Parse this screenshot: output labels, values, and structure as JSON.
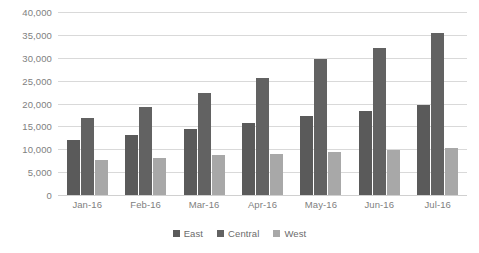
{
  "chart_data": {
    "type": "bar",
    "title": "",
    "subtitle": "",
    "xlabel": "",
    "ylabel": "",
    "categories": [
      "Jan-16",
      "Feb-16",
      "Mar-16",
      "Apr-16",
      "May-16",
      "Jun-16",
      "Jul-16"
    ],
    "series": [
      {
        "name": "East",
        "color": "#5a5a5a",
        "values": [
          12000,
          13200,
          14400,
          15700,
          17200,
          18400,
          19700
        ]
      },
      {
        "name": "Central",
        "color": "#626262",
        "values": [
          16800,
          19200,
          22200,
          25500,
          29700,
          32200,
          35500
        ]
      },
      {
        "name": "West",
        "color": "#a8a8a8",
        "values": [
          7700,
          8200,
          8700,
          9000,
          9400,
          9800,
          10300
        ]
      }
    ],
    "ylim": [
      0,
      40000
    ],
    "ytick_values": [
      0,
      5000,
      10000,
      15000,
      20000,
      25000,
      30000,
      35000,
      40000
    ],
    "ytick_labels": [
      "0",
      "5,000",
      "10,000",
      "15,000",
      "20,000",
      "25,000",
      "30,000",
      "35,000",
      "40,000"
    ],
    "grid": true,
    "grid_axis": "y",
    "grid_color": "#d9d9d9",
    "legend": true,
    "legend_position": "bottom",
    "background_color": "#ffffff",
    "axis_label_color": "#808080"
  }
}
